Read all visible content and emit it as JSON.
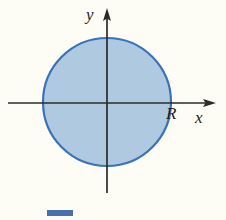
{
  "figure": {
    "name": "circle-region-diagram",
    "background_color": "#fdfcf5",
    "width": 226,
    "height": 220
  },
  "axes": {
    "color": "#2b2b29",
    "x_axis": {
      "label": "x",
      "start_x": 8,
      "end_x": 216,
      "y": 103,
      "arrow": "right"
    },
    "y_axis": {
      "label": "y",
      "x": 107,
      "start_y": 193,
      "end_y": 9,
      "arrow": "up"
    }
  },
  "shape": {
    "type": "circle",
    "center_x": 107,
    "center_y": 102,
    "radius": 64,
    "fill_color": "#aec9e0",
    "stroke_color": "#3a72b8",
    "stroke_width": 2.2,
    "radius_label": "R"
  },
  "caption": {
    "swatch_color": "#4a6fae",
    "text": ""
  }
}
